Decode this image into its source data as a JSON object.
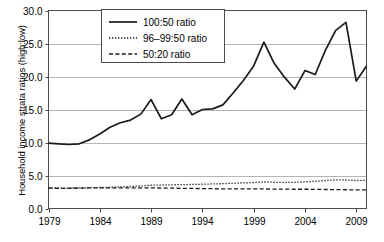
{
  "chart_data": {
    "type": "line",
    "title": "",
    "xlabel": "",
    "ylabel": "Household income strata ratios (high:low)",
    "xlim": [
      1979,
      2010
    ],
    "ylim": [
      0.0,
      30.0
    ],
    "yticks": [
      "0.0",
      "5.0",
      "10.0",
      "15.0",
      "20.0",
      "25.0",
      "30.0"
    ],
    "ytick_values": [
      0.0,
      5.0,
      10.0,
      15.0,
      20.0,
      25.0,
      30.0
    ],
    "xticks": [
      "1979",
      "1984",
      "1989",
      "1994",
      "1999",
      "2004",
      "2009"
    ],
    "xtick_values": [
      1979,
      1984,
      1989,
      1994,
      1999,
      2004,
      2009
    ],
    "grid": "horizontal",
    "legend_position": "top-center",
    "x": [
      1979,
      1980,
      1981,
      1982,
      1983,
      1984,
      1985,
      1986,
      1987,
      1988,
      1989,
      1990,
      1991,
      1992,
      1993,
      1994,
      1995,
      1996,
      1997,
      1998,
      1999,
      2000,
      2001,
      2002,
      2003,
      2004,
      2005,
      2006,
      2007,
      2008,
      2009,
      2010
    ],
    "series": [
      {
        "name": "100:50 ratio",
        "style": "solid",
        "values": [
          9.9,
          9.8,
          9.7,
          9.8,
          10.4,
          11.3,
          12.3,
          13.0,
          13.4,
          14.3,
          16.5,
          13.6,
          14.2,
          16.6,
          14.2,
          15.0,
          15.1,
          15.7,
          17.5,
          19.4,
          21.6,
          25.2,
          22.0,
          19.9,
          18.1,
          20.9,
          20.3,
          24.0,
          27.0,
          28.2,
          19.3,
          21.6
        ]
      },
      {
        "name": "96–99:50 ratio",
        "style": "dotted",
        "values": [
          3.12,
          3.1,
          3.1,
          3.12,
          3.15,
          3.18,
          3.22,
          3.28,
          3.34,
          3.42,
          3.52,
          3.56,
          3.58,
          3.62,
          3.64,
          3.68,
          3.72,
          3.76,
          3.82,
          3.88,
          3.94,
          4.02,
          3.98,
          3.94,
          3.96,
          4.04,
          4.12,
          4.24,
          4.34,
          4.32,
          4.24,
          4.26
        ]
      },
      {
        "name": "50:20 ratio",
        "style": "dashed",
        "values": [
          3.08,
          3.06,
          3.06,
          3.08,
          3.12,
          3.14,
          3.14,
          3.14,
          3.12,
          3.12,
          3.12,
          3.1,
          3.08,
          3.06,
          3.04,
          3.02,
          3.0,
          2.98,
          2.96,
          2.96,
          2.96,
          2.96,
          2.94,
          2.94,
          2.92,
          2.92,
          2.9,
          2.88,
          2.86,
          2.84,
          2.82,
          2.82
        ]
      }
    ]
  },
  "legend": {
    "items": [
      {
        "label": "100:50 ratio",
        "style": "solid"
      },
      {
        "label": "96–99:50 ratio",
        "style": "dotted"
      },
      {
        "label": "50:20 ratio",
        "style": "dashed"
      }
    ]
  },
  "axes": {
    "y_axis_title": "Household income strata ratios (high:low)"
  },
  "colors": {
    "line": "#1a1a1a",
    "grid": "#b4b4b4",
    "axis": "#4d4d4d",
    "text": "#000000",
    "background": "#ffffff"
  }
}
